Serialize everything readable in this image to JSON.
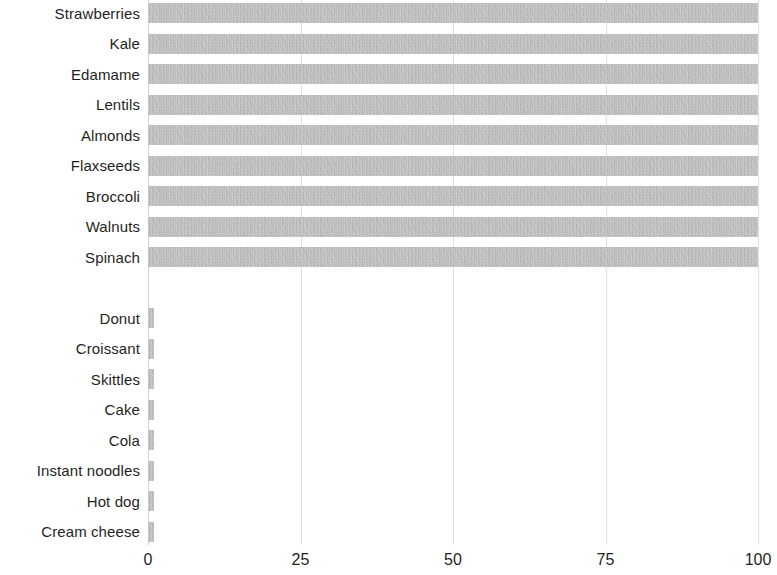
{
  "chart_data": {
    "type": "bar",
    "orientation": "horizontal",
    "title": "",
    "subtitle": "",
    "xlabel": "",
    "ylabel": "",
    "xlim": [
      0,
      100
    ],
    "ylim": null,
    "grid": true,
    "grid_axis": "x",
    "legend": false,
    "legend_position": "none",
    "bar_color": "#b4b4b4",
    "text_color": "#1f1f1f",
    "gridline_color": "#e0e0e0",
    "background_color": "#ffffff",
    "xticks": [
      0,
      25,
      50,
      75,
      100
    ],
    "xtick_labels": [
      "0",
      "25",
      "50",
      "75",
      "100"
    ],
    "categories": [
      "Strawberries",
      "Kale",
      "Edamame",
      "Lentils",
      "Almonds",
      "Flaxseeds",
      "Broccoli",
      "Walnuts",
      "Spinach",
      "",
      "Donut",
      "Croissant",
      "Skittles",
      "Cake",
      "Cola",
      "Instant noodles",
      "Hot dog",
      "Cream cheese"
    ],
    "values": [
      100,
      100,
      100,
      100,
      100,
      100,
      100,
      100,
      100,
      0,
      1,
      1,
      1,
      1,
      1,
      1,
      1,
      1
    ],
    "groups": [
      {
        "name": "healthy-foods",
        "categories": [
          "Strawberries",
          "Kale",
          "Edamame",
          "Lentils",
          "Almonds",
          "Flaxseeds",
          "Broccoli",
          "Walnuts",
          "Spinach"
        ],
        "values": [
          100,
          100,
          100,
          100,
          100,
          100,
          100,
          100,
          100
        ]
      },
      {
        "name": "unhealthy-foods",
        "categories": [
          "Donut",
          "Croissant",
          "Skittles",
          "Cake",
          "Cola",
          "Instant noodles",
          "Hot dog",
          "Cream cheese"
        ],
        "values": [
          1,
          1,
          1,
          1,
          1,
          1,
          1,
          1
        ]
      }
    ]
  }
}
